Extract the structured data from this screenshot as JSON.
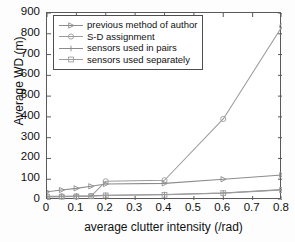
{
  "chart_data": {
    "type": "line",
    "title": "",
    "xlabel": "average clutter intensity (/rad)",
    "ylabel": "Average WD (m)",
    "xlim": [
      0,
      0.8
    ],
    "ylim": [
      0,
      900
    ],
    "xticks": [
      "0",
      "0.1",
      "0.2",
      "0.3",
      "0.4",
      "0.5",
      "0.6",
      "0.7",
      "0.8"
    ],
    "xtick_values": [
      0,
      0.1,
      0.2,
      0.3,
      0.4,
      0.5,
      0.6,
      0.7,
      0.8
    ],
    "yticks": [
      "0",
      "100",
      "200",
      "300",
      "400",
      "500",
      "600",
      "700",
      "800",
      "900"
    ],
    "ytick_values": [
      0,
      100,
      200,
      300,
      400,
      500,
      600,
      700,
      800,
      900
    ],
    "grid": false,
    "legend_position": "upper left",
    "series": [
      {
        "name": "previous method of author",
        "marker": "triangle-right",
        "color": "#8c8c8c",
        "x": [
          0,
          0.05,
          0.1,
          0.15,
          0.2,
          0.4,
          0.6,
          0.8
        ],
        "values": [
          40,
          48,
          56,
          66,
          77,
          80,
          100,
          120
        ]
      },
      {
        "name": "S-D assignment",
        "marker": "circle",
        "color": "#9a9a9a",
        "x": [
          0,
          0.05,
          0.1,
          0.15,
          0.2,
          0.4,
          0.6,
          0.8
        ],
        "values": [
          18,
          17,
          17,
          19,
          90,
          95,
          390,
          835
        ]
      },
      {
        "name": "sensors used in pairs",
        "marker": "plus",
        "color": "#8a8a8a",
        "x": [
          0,
          0.05,
          0.1,
          0.15,
          0.2,
          0.4,
          0.6,
          0.8
        ],
        "values": [
          17,
          18,
          19,
          20,
          23,
          26,
          34,
          50
        ]
      },
      {
        "name": "sensors used separately",
        "marker": "square",
        "color": "#9d9d9d",
        "x": [
          0,
          0.05,
          0.1,
          0.15,
          0.2,
          0.4,
          0.6,
          0.8
        ],
        "values": [
          15,
          16,
          17,
          18,
          22,
          25,
          33,
          48
        ]
      }
    ]
  },
  "axes": {
    "y_title": "Average WD (m)",
    "x_title": "average clutter intensity (/rad)"
  },
  "legend": {
    "entries": [
      {
        "label": "previous method of author",
        "marker": "triangle-right"
      },
      {
        "label": "S-D assignment",
        "marker": "circle"
      },
      {
        "label": "sensors used in pairs",
        "marker": "plus"
      },
      {
        "label": "sensors used separately",
        "marker": "square"
      }
    ]
  }
}
